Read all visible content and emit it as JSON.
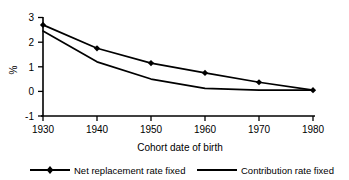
{
  "chart_data": {
    "type": "line",
    "title": "",
    "subtitle": "",
    "xlabel": "Cohort date of birth",
    "ylabel": "%",
    "x": [
      1930,
      1940,
      1950,
      1960,
      1970,
      1980
    ],
    "categories": [
      "1930",
      "1940",
      "1950",
      "1960",
      "1970",
      "1980"
    ],
    "xlim": [
      1930,
      1980
    ],
    "ylim": [
      -1,
      3
    ],
    "yticks": [
      -1,
      0,
      1,
      2,
      3
    ],
    "ytick_labels": [
      "-1",
      "0",
      "1",
      "2",
      "3"
    ],
    "xticks": [
      1930,
      1940,
      1950,
      1960,
      1970,
      1980
    ],
    "xtick_labels": [
      "1930",
      "1940",
      "1950",
      "1960",
      "1970",
      "1980"
    ],
    "grid": false,
    "legend_position": "bottom",
    "series": [
      {
        "name": "Net replacement rate fixed",
        "marker": "diamond",
        "color": "#000000",
        "values": [
          2.7,
          1.75,
          1.15,
          0.75,
          0.37,
          0.05
        ]
      },
      {
        "name": "Contribution rate fixed",
        "marker": "none",
        "color": "#000000",
        "values": [
          2.45,
          1.2,
          0.5,
          0.12,
          0.05,
          0.05
        ]
      }
    ],
    "annotations": []
  },
  "axis": {
    "y_label": "%",
    "x_label": "Cohort date of birth",
    "y_tick_3": "3",
    "y_tick_2": "2",
    "y_tick_1": "1",
    "y_tick_0": "0",
    "y_tick_m1": "-1",
    "x_tick_1930": "1930",
    "x_tick_1940": "1940",
    "x_tick_1950": "1950",
    "x_tick_1960": "1960",
    "x_tick_1970": "1970",
    "x_tick_1980": "1980"
  },
  "legend": {
    "entries": [
      {
        "label": "Net replacement rate fixed",
        "marker": "diamond"
      },
      {
        "label": "Contribution rate fixed",
        "marker": "none"
      }
    ],
    "entry_0_label": "Net replacement rate fixed",
    "entry_1_label": "Contribution rate fixed"
  },
  "colors": {
    "line": "#000000",
    "axis": "#000000",
    "background": "#ffffff"
  }
}
